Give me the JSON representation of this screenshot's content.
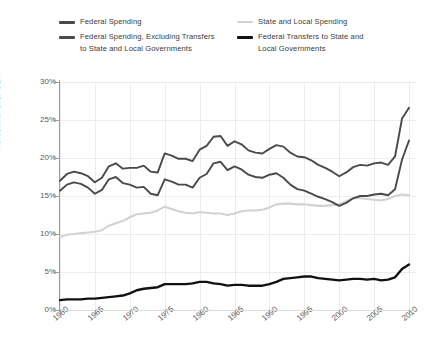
{
  "chart_data": {
    "type": "line",
    "title": "",
    "xlabel": "",
    "ylabel": "Percent of U.S. GDP",
    "xlim": [
      1960,
      2011
    ],
    "ylim": [
      0,
      30
    ],
    "grid": true,
    "legend_position": "top",
    "ytick_labels": [
      "0%",
      "5%",
      "10%",
      "15%",
      "20%",
      "25%",
      "30%"
    ],
    "ytick_values": [
      0,
      5,
      10,
      15,
      20,
      25,
      30
    ],
    "xtick_labels": [
      "1960",
      "1965",
      "1970",
      "1975",
      "1980",
      "1985",
      "1990",
      "1995",
      "2000",
      "2005",
      "2010"
    ],
    "xtick_values": [
      1960,
      1965,
      1970,
      1975,
      1980,
      1985,
      1990,
      1995,
      2000,
      2005,
      2010
    ],
    "x": [
      1960,
      1961,
      1962,
      1963,
      1964,
      1965,
      1966,
      1967,
      1968,
      1969,
      1970,
      1971,
      1972,
      1973,
      1974,
      1975,
      1976,
      1977,
      1978,
      1979,
      1980,
      1981,
      1982,
      1983,
      1984,
      1985,
      1986,
      1987,
      1988,
      1989,
      1990,
      1991,
      1992,
      1993,
      1994,
      1995,
      1996,
      1997,
      1998,
      1999,
      2000,
      2001,
      2002,
      2003,
      2004,
      2005,
      2006,
      2007,
      2008,
      2009,
      2010
    ],
    "series": [
      {
        "name": "Federal Spending",
        "color": "#4a4a4a",
        "width": 1.9,
        "values": [
          17.0,
          17.9,
          18.2,
          18.0,
          17.6,
          16.8,
          17.4,
          18.9,
          19.3,
          18.6,
          18.7,
          18.7,
          19.0,
          18.2,
          18.1,
          20.6,
          20.3,
          19.9,
          19.9,
          19.6,
          21.1,
          21.6,
          22.8,
          22.9,
          21.6,
          22.2,
          21.8,
          21.0,
          20.7,
          20.6,
          21.2,
          21.7,
          21.5,
          20.7,
          20.2,
          20.1,
          19.7,
          19.1,
          18.7,
          18.2,
          17.6,
          18.1,
          18.8,
          19.1,
          19.0,
          19.3,
          19.4,
          19.1,
          20.2,
          25.2,
          26.6
        ]
      },
      {
        "name": "Federal Spending, Excluding Transfers\nto State and Local Governments",
        "color": "#4a4a4a",
        "width": 1.9,
        "values": [
          15.7,
          16.5,
          16.8,
          16.6,
          16.1,
          15.3,
          15.8,
          17.2,
          17.5,
          16.7,
          16.5,
          16.1,
          16.2,
          15.3,
          15.1,
          17.2,
          16.9,
          16.5,
          16.5,
          16.1,
          17.4,
          17.9,
          19.3,
          19.5,
          18.4,
          18.9,
          18.5,
          17.8,
          17.5,
          17.4,
          17.8,
          18.0,
          17.4,
          16.5,
          15.9,
          15.7,
          15.3,
          14.9,
          14.6,
          14.2,
          13.7,
          14.1,
          14.7,
          15.0,
          15.0,
          15.2,
          15.3,
          15.1,
          15.9,
          19.8,
          22.3
        ]
      },
      {
        "name": "State and Local Spending",
        "color": "#d2d2d2",
        "width": 2.1,
        "values": [
          9.6,
          9.9,
          10.0,
          10.1,
          10.2,
          10.3,
          10.5,
          11.1,
          11.4,
          11.7,
          12.2,
          12.6,
          12.7,
          12.8,
          13.1,
          13.6,
          13.3,
          13.0,
          12.8,
          12.7,
          12.9,
          12.8,
          12.7,
          12.7,
          12.5,
          12.7,
          13.0,
          13.1,
          13.1,
          13.2,
          13.5,
          13.9,
          14.0,
          14.0,
          13.9,
          13.9,
          13.8,
          13.7,
          13.7,
          13.8,
          13.9,
          14.3,
          14.7,
          14.7,
          14.6,
          14.5,
          14.4,
          14.6,
          15.0,
          15.2,
          15.1
        ]
      },
      {
        "name": "Federal Transfers to State and\nLocal Governments",
        "color": "#111111",
        "width": 2.4,
        "values": [
          1.3,
          1.4,
          1.4,
          1.4,
          1.5,
          1.5,
          1.6,
          1.7,
          1.8,
          1.9,
          2.2,
          2.6,
          2.8,
          2.9,
          3.0,
          3.4,
          3.4,
          3.4,
          3.4,
          3.5,
          3.7,
          3.7,
          3.5,
          3.4,
          3.2,
          3.3,
          3.3,
          3.2,
          3.2,
          3.2,
          3.4,
          3.7,
          4.1,
          4.2,
          4.3,
          4.4,
          4.4,
          4.2,
          4.1,
          4.0,
          3.9,
          4.0,
          4.1,
          4.1,
          4.0,
          4.1,
          3.9,
          4.0,
          4.3,
          5.4,
          6.0
        ]
      }
    ]
  },
  "legend": {
    "items": [
      {
        "label": "Federal Spending",
        "color": "#4a4a4a"
      },
      {
        "label": "Federal Spending, Excluding Transfers\nto State and Local Governments",
        "color": "#4a4a4a"
      },
      {
        "label": "State and Local Spending",
        "color": "#d2d2d2"
      },
      {
        "label": "Federal Transfers to State and\nLocal Governments",
        "color": "#111111"
      }
    ]
  },
  "axes": {
    "ylabel": "Percent of U.S. GDP"
  }
}
